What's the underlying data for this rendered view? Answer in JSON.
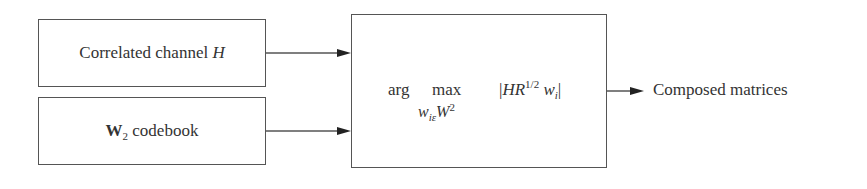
{
  "diagram": {
    "inputs": [
      {
        "label": "Correlated channel ",
        "symbol": "H"
      },
      {
        "symbol": "W",
        "subscript": "2",
        "label": " codebook"
      }
    ],
    "process": {
      "operator_1": "arg",
      "operator_2": "max",
      "constraint_var": "w",
      "constraint_sub": "i",
      "constraint_rel": "ε",
      "constraint_set": "W",
      "constraint_set_sup": "2",
      "objective_open": "|",
      "objective_H": "H",
      "objective_R": "R",
      "objective_R_sup": "1/2",
      "objective_w": "w",
      "objective_w_sub": "i",
      "objective_close": "|"
    },
    "output": {
      "label": "Composed matrices"
    },
    "colors": {
      "stroke": "#555555",
      "text": "#333333",
      "arrowhead": "#222222"
    }
  }
}
